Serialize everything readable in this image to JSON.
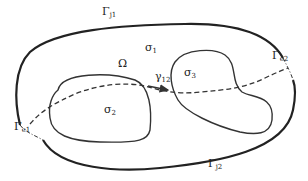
{
  "diagram": {
    "type": "domain-decomposition-schematic",
    "colors": {
      "stroke": "#222222",
      "background": "#ffffff"
    },
    "labels": {
      "gamma_j1": {
        "base": "Γ",
        "sub": "j1"
      },
      "gamma_j2": {
        "base": "Γ",
        "sub": "j2"
      },
      "gamma_e1": {
        "base": "Γ",
        "sub": "e1"
      },
      "gamma_e2": {
        "base": "Γ",
        "sub": "e2"
      },
      "omega": {
        "base": "Ω"
      },
      "sigma1": {
        "base": "σ",
        "sub": "1"
      },
      "sigma2": {
        "base": "σ",
        "sub": "2"
      },
      "sigma3": {
        "base": "σ",
        "sub": "3"
      },
      "gamma12": {
        "base": "γ",
        "sub": "12"
      }
    },
    "elements": [
      "outer-boundary-solid (Γj1 top, Γj2 bottom)",
      "outer-boundary-dashdot segments at Γe1 and Γe2",
      "inner-region σ2 (left closed curve)",
      "inner-region σ3 (right closed curve)",
      "dashed path crossing from Γe1 through σ2, σ3 to Γe2",
      "arrow γ12 pointing from σ2 toward σ3"
    ]
  }
}
